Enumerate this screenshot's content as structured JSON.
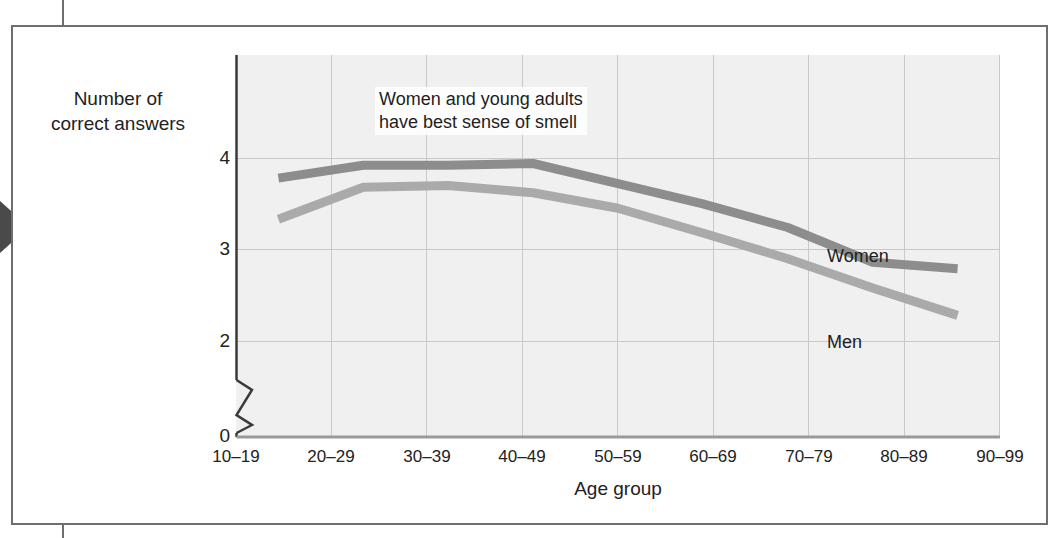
{
  "figure": {
    "y_axis_title": "Number of\ncorrect answers",
    "x_axis_title": "Age group",
    "annotation": "Women and young adults\nhave best sense of smell",
    "series_labels": {
      "women": "Women",
      "men": "Men"
    },
    "colors": {
      "women_line": "#8d8d8d",
      "men_line": "#aaaaaa",
      "plot_background": "#f0f0f0",
      "gridline": "#c9c9c9",
      "axis": "#3a3a3a",
      "frame": "#6e6e6e"
    }
  },
  "chart_data": {
    "type": "line",
    "title": "",
    "subtitle": "",
    "xlabel": "Age group",
    "ylabel": "Number of correct answers",
    "categories": [
      "10–19",
      "20–29",
      "30–39",
      "40–49",
      "50–59",
      "60–69",
      "70–79",
      "80–89",
      "90–99"
    ],
    "ytick_labels": [
      "0",
      "2",
      "3",
      "4"
    ],
    "ytick_values": [
      0,
      2,
      3,
      4
    ],
    "ylim": [
      2,
      4.18
    ],
    "axis_break": true,
    "axis_break_between": [
      0,
      2
    ],
    "grid": true,
    "grid_axis": "both",
    "legend": "inline-labels",
    "series": [
      {
        "name": "Women",
        "color": "#8d8d8d",
        "values": [
          3.78,
          3.92,
          3.92,
          3.94,
          3.72,
          3.5,
          3.24,
          2.86,
          2.79
        ]
      },
      {
        "name": "Men",
        "color": "#aaaaaa",
        "values": [
          3.33,
          3.68,
          3.7,
          3.62,
          3.45,
          3.18,
          2.9,
          2.58,
          2.28
        ]
      }
    ],
    "annotations": [
      {
        "text": "Women and young adults have best sense of smell",
        "x": "30–39",
        "y": 4.1
      },
      {
        "text": "Women",
        "x": "70–79",
        "y": 3.3
      },
      {
        "text": "Men",
        "x": "70–79",
        "y": 2.4
      }
    ]
  }
}
